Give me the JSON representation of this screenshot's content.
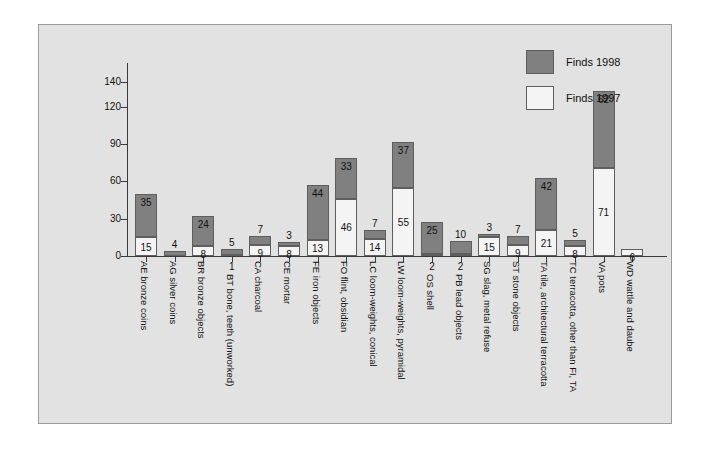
{
  "legend": {
    "position": "top-right",
    "entries": [
      {
        "label": "Finds 1998",
        "color": "#808080"
      },
      {
        "label": "Finds 1997",
        "color": "#f4f4f4"
      }
    ]
  },
  "chart_data": {
    "type": "bar",
    "subtype": "stacked",
    "title": "",
    "xlabel": "",
    "ylabel": "",
    "ylim": [
      0,
      140
    ],
    "yticks": [
      0,
      30,
      60,
      90,
      120,
      140
    ],
    "grid": false,
    "categories": [
      "AE bronze coins",
      "AG silver coins",
      "BR bronze objects",
      "BT bone, teeth (unworked)",
      "CA charcoal",
      "CE mortar",
      "FE iron objects",
      "FO flint, obsidian",
      "LC loom-weights, conical",
      "LW loom-weights, pyramidal",
      "OS shell",
      "PB lead objects",
      "SG slag, metal refuse",
      "ST stone objects",
      "TA tile, architectural terracotta",
      "TC terracotta, other than FI, TA",
      "VA pots",
      "WD wattle and daube"
    ],
    "series": [
      {
        "name": "Finds 1998",
        "color": "#808080",
        "values": [
          35,
          4,
          24,
          5,
          7,
          3,
          44,
          33,
          7,
          37,
          25,
          10,
          3,
          7,
          42,
          5,
          62,
          0
        ]
      },
      {
        "name": "Finds 1997",
        "color": "#f4f4f4",
        "values": [
          15,
          0,
          8,
          1,
          9,
          8,
          13,
          46,
          14,
          55,
          2,
          2,
          15,
          9,
          21,
          8,
          71,
          6
        ]
      }
    ],
    "totals": [
      50,
      4,
      32,
      6,
      16,
      11,
      57,
      79,
      21,
      92,
      27,
      12,
      18,
      16,
      63,
      13,
      133,
      6
    ]
  }
}
